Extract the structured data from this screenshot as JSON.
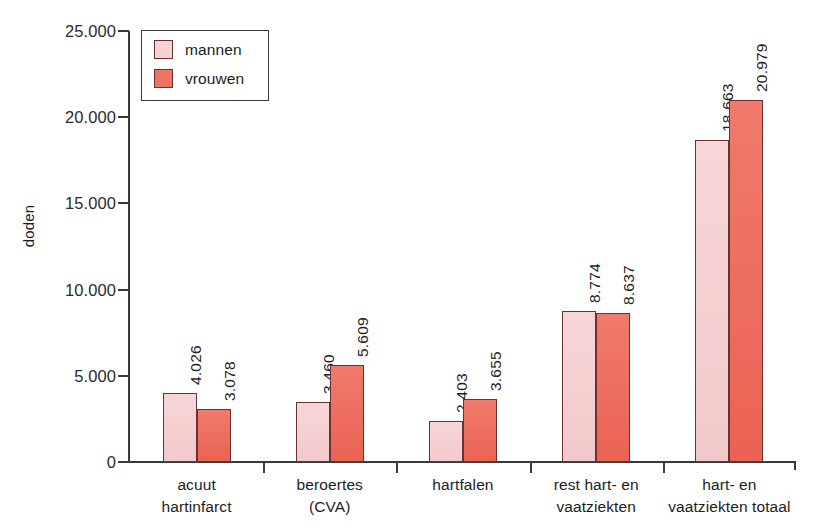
{
  "chart_data": {
    "type": "bar",
    "title": "",
    "xlabel": "",
    "ylabel": "doden",
    "ylim": [
      0,
      25000
    ],
    "ytick_labels": [
      "25.000",
      "20.000",
      "15.000",
      "10.000",
      "5.000",
      "0"
    ],
    "ytick_values": [
      25000,
      20000,
      15000,
      10000,
      5000,
      0
    ],
    "grid": false,
    "legend_position": "top-left",
    "categories": [
      "acuut\nhartinfarct",
      "beroertes\n(CVA)",
      "hartfalen",
      "rest hart- en\nvaatziekten",
      "hart- en\nvaatziekten totaal"
    ],
    "category_lines": [
      [
        "acuut",
        "hartinfarct"
      ],
      [
        "beroertes",
        "(CVA)"
      ],
      [
        "hartfalen",
        ""
      ],
      [
        "rest hart- en",
        "vaatziekten"
      ],
      [
        "hart- en",
        "vaatziekten totaal"
      ]
    ],
    "series": [
      {
        "name": "mannen",
        "color": "#f6d2d3",
        "values": [
          4026,
          3460,
          2403,
          8774,
          18663
        ],
        "labels": [
          "4.026",
          "3.460",
          "2.403",
          "8.774",
          "18.663"
        ]
      },
      {
        "name": "vrouwen",
        "color": "#ef7263",
        "values": [
          3078,
          5609,
          3655,
          8637,
          20979
        ],
        "labels": [
          "3.078",
          "5.609",
          "3.655",
          "8.637",
          "20.979"
        ]
      }
    ]
  },
  "legend": {
    "items": [
      {
        "label": "mannen",
        "color": "#f6d2d3"
      },
      {
        "label": "vrouwen",
        "color": "#ef7263"
      }
    ]
  },
  "axes": {
    "y_title": "doden"
  }
}
